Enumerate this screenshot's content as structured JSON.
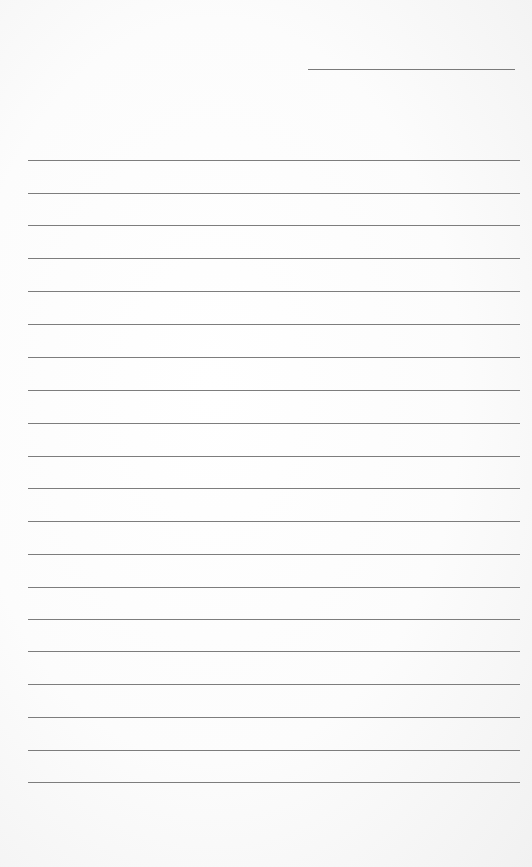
{
  "document": {
    "type": "lined-paper",
    "date_line": {
      "label": ""
    },
    "rule_count": 20,
    "rule_positions_y": [
      160,
      193,
      225,
      258,
      291,
      324,
      357,
      390,
      423,
      456,
      488,
      521,
      554,
      587,
      619,
      651,
      684,
      717,
      750,
      782
    ],
    "line_color": "#7d7d7d",
    "paper_color": "#ffffff"
  }
}
